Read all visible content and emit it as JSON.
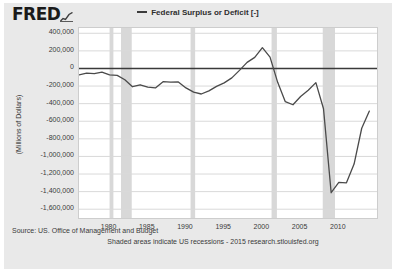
{
  "header": {
    "logo_text": "FRED",
    "logo_mark_icon": "mini-line-chart-icon"
  },
  "legend": {
    "swatch_icon": "line-swatch-icon",
    "label": "Federal Surplus or Deficit [-]"
  },
  "footer": {
    "source": "Source: US. Office of Management and Budget",
    "note": "Shaded areas indicate US recessions - 2015 research.stlouisfed.org"
  },
  "chart_data": {
    "type": "line",
    "title": "",
    "xlabel": "",
    "ylabel": "(Millions of Dollars)",
    "grid": true,
    "legend_position": "top-center",
    "xlim": [
      1976,
      2015
    ],
    "ylim": [
      -1700000,
      460000
    ],
    "yticks": [
      400000,
      200000,
      0,
      -200000,
      -400000,
      -600000,
      -800000,
      -1000000,
      -1200000,
      -1400000,
      -1600000
    ],
    "ytick_labels": [
      "400,000",
      "200,000",
      "0",
      "-200,000",
      "-400,000",
      "-600,000",
      "-800,000",
      "-1,000,000",
      "-1,200,000",
      "-1,400,000",
      "-1,600,000"
    ],
    "xticks": [
      1980,
      1985,
      1990,
      1995,
      2000,
      2005,
      2010
    ],
    "xtick_labels": [
      "1980",
      "1985",
      "1990",
      "1995",
      "2000",
      "2005",
      "2010"
    ],
    "series": [
      {
        "name": "Federal Surplus or Deficit [-]",
        "color": "#4a4a4a",
        "x": [
          1976,
          1977,
          1978,
          1979,
          1980,
          1981,
          1982,
          1983,
          1984,
          1985,
          1986,
          1987,
          1988,
          1989,
          1990,
          1991,
          1992,
          1993,
          1994,
          1995,
          1996,
          1997,
          1998,
          1999,
          2000,
          2001,
          2002,
          2003,
          2004,
          2005,
          2006,
          2007,
          2008,
          2009,
          2010,
          2011,
          2012,
          2013,
          2014
        ],
        "values": [
          -73732,
          -53659,
          -59186,
          -40726,
          -73835,
          -78976,
          -127977,
          -207802,
          -185367,
          -212308,
          -221227,
          -149730,
          -155178,
          -152639,
          -221036,
          -269238,
          -290321,
          -255051,
          -203186,
          -163952,
          -107431,
          -21884,
          69270,
          125610,
          236241,
          128236,
          -157758,
          -377585,
          -412727,
          -318346,
          -248181,
          -160701,
          -458553,
          -1412688,
          -1294373,
          -1299593,
          -1086957,
          -679544,
          -484600
        ]
      }
    ],
    "zero_line": 0,
    "recession_bands": [
      {
        "start": 1980.0,
        "end": 1980.5
      },
      {
        "start": 1981.5,
        "end": 1982.9
      },
      {
        "start": 1990.6,
        "end": 1991.2
      },
      {
        "start": 2001.2,
        "end": 2001.9
      },
      {
        "start": 2007.9,
        "end": 2009.5
      }
    ]
  }
}
